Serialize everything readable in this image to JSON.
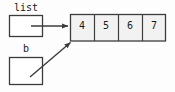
{
  "diagram": {
    "colors": {
      "background": "#fdfdfd",
      "stroke": "#3c3c3c",
      "cell_fill": "#f2f2f2",
      "box_fill": "#ffffff",
      "text": "#1a1a1a"
    },
    "variables": [
      {
        "name": "list",
        "label": "list",
        "box": {
          "x": 9,
          "y": 15,
          "width": 34,
          "height": 22
        },
        "arrow": {
          "kind": "straight-horizontal",
          "from": {
            "x": 43,
            "y": 26
          },
          "to": {
            "x": 69,
            "y": 26
          }
        }
      },
      {
        "name": "b",
        "label": "b",
        "box": {
          "x": 9,
          "y": 57,
          "width": 34,
          "height": 28
        },
        "arrow": {
          "kind": "diagonal",
          "from": {
            "x": 31,
            "y": 76
          },
          "to": {
            "x": 72,
            "y": 41
          }
        }
      }
    ],
    "array": {
      "name": "values-array",
      "x": 70,
      "y": 14,
      "cell_width": 24,
      "cell_height": 27,
      "cells": [
        {
          "index": 0,
          "value": "4"
        },
        {
          "index": 1,
          "value": "5"
        },
        {
          "index": 2,
          "value": "6"
        },
        {
          "index": 3,
          "value": "7"
        }
      ]
    }
  }
}
